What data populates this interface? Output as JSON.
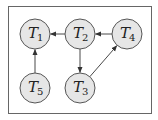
{
  "diagram": {
    "type": "directed-graph",
    "nodes": [
      {
        "id": "T1",
        "letter": "T",
        "sub": "1",
        "cx": 35,
        "cy": 34
      },
      {
        "id": "T2",
        "letter": "T",
        "sub": "2",
        "cx": 80,
        "cy": 34
      },
      {
        "id": "T4",
        "letter": "T",
        "sub": "4",
        "cx": 127,
        "cy": 34
      },
      {
        "id": "T5",
        "letter": "T",
        "sub": "5",
        "cx": 35,
        "cy": 88
      },
      {
        "id": "T3",
        "letter": "T",
        "sub": "3",
        "cx": 80,
        "cy": 88
      }
    ],
    "edges": [
      {
        "from": "T2",
        "to": "T1"
      },
      {
        "from": "T4",
        "to": "T2"
      },
      {
        "from": "T2",
        "to": "T3"
      },
      {
        "from": "T3",
        "to": "T4"
      },
      {
        "from": "T5",
        "to": "T1"
      }
    ]
  }
}
